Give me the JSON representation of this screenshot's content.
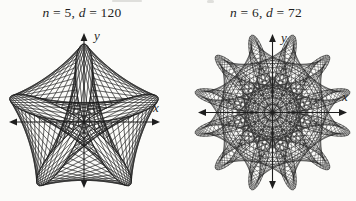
{
  "colors": {
    "ink": "#1e1e1e",
    "paper": "#fbfbf9"
  },
  "figures": [
    {
      "caption": {
        "var_n": "n",
        "val_n": " = 5, ",
        "var_d": "d",
        "val_d": " = 120"
      },
      "x_axis_label": "x",
      "y_axis_label": "y"
    },
    {
      "caption": {
        "var_n": "n",
        "val_n": " = 6, ",
        "var_d": "d",
        "val_d": " = 72"
      },
      "x_axis_label": "x",
      "y_axis_label": "y"
    }
  ],
  "chart_data": [
    {
      "type": "line",
      "subtype": "maurer-rose",
      "title": "n = 5, d = 120",
      "polar_equation": "r = sin(nθ)",
      "n": 5,
      "d_degrees": 120,
      "theta_degrees_range": [
        0,
        360
      ],
      "construction": "chord from angle k to angle k+d on r = sin(nθ) for each integer degree k",
      "xlabel": "x",
      "ylabel": "y",
      "grid": false,
      "ticks": false,
      "axes_style": "centered cross with solid arrowheads on all four ends",
      "layout": {
        "cx": 84,
        "cy": 122,
        "r": 78,
        "axis_left": 9,
        "axis_right": 160,
        "axis_top": 33,
        "axis_bottom": 188
      }
    },
    {
      "type": "line",
      "subtype": "maurer-rose",
      "title": "n = 6, d = 72",
      "polar_equation": "r = sin(nθ)",
      "n": 6,
      "d_degrees": 72,
      "theta_degrees_range": [
        0,
        360
      ],
      "construction": "chord from angle k to angle k+d on r = sin(nθ) for each integer degree k",
      "xlabel": "x",
      "ylabel": "y",
      "grid": false,
      "ticks": false,
      "axes_style": "centered cross with solid arrowheads on all four ends",
      "layout": {
        "cx": 272.5,
        "cy": 112.5,
        "r": 80,
        "axis_left": 198,
        "axis_right": 347,
        "axis_top": 34,
        "axis_bottom": 189
      }
    }
  ]
}
